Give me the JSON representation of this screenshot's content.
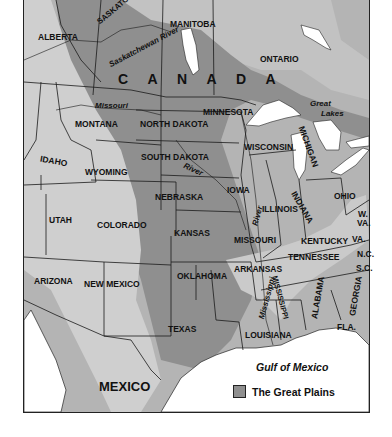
{
  "map": {
    "title": "The Great Plains region of North America",
    "colors": {
      "land": "#b4b4b4",
      "great_plains": "#8f8f8f",
      "highlands": "#cfcfcf",
      "water": "#ffffff",
      "border": "#1a1a1a"
    },
    "countries": {
      "canada": "C A N A D A",
      "mexico": "MEXICO"
    },
    "provinces": [
      "ALBERTA",
      "SASKATCHEWAN",
      "MANITOBA",
      "ONTARIO"
    ],
    "states": {
      "montana": "MONTANA",
      "north_dakota": "NORTH DAKOTA",
      "minnesota": "MINNESOTA",
      "wisconsin": "WISCONSIN",
      "michigan": "MICHIGAN",
      "idaho": "IDAHO",
      "wyoming": "WYOMING",
      "south_dakota": "SOUTH DAKOTA",
      "iowa": "IOWA",
      "illinois": "ILLINOIS",
      "indiana": "INDIANA",
      "ohio": "OHIO",
      "nebraska": "NEBRASKA",
      "utah": "UTAH",
      "colorado": "COLORADO",
      "kansas": "KANSAS",
      "missouri": "MISSOURI",
      "kentucky": "KENTUCKY",
      "west_virginia_1": "W.",
      "west_virginia_2": "VA.",
      "virginia": "VA.",
      "arizona": "ARIZONA",
      "new_mexico": "NEW MEXICO",
      "oklahoma": "OKLAHOMA",
      "arkansas": "ARKANSAS",
      "tennessee": "TENNESSEE",
      "north_carolina": "N.C.",
      "south_carolina": "S.C.",
      "texas": "TEXAS",
      "louisiana": "LOUISIANA",
      "mississippi": "MISSISSIPPI",
      "alabama": "ALABAMA",
      "georgia": "GEORGIA",
      "florida": "FLA."
    },
    "rivers": {
      "saskatchewan": "Saskatchewan River",
      "missouri": "Missouri",
      "missouri_river_lower": "River",
      "mississippi": "Mississippi",
      "mississippi_river": "River"
    },
    "water_bodies": {
      "great_lakes_1": "Great",
      "great_lakes_2": "Lakes",
      "gulf": "Gulf of Mexico"
    },
    "legend": {
      "label": "The Great Plains",
      "swatch_color": "#8f8f8f"
    }
  }
}
